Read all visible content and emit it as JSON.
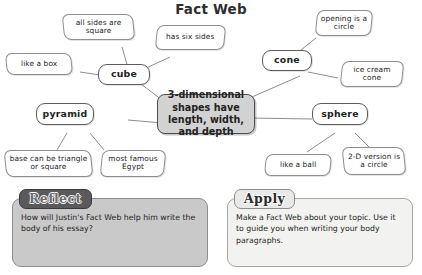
{
  "title": "Fact Web",
  "center_node": {
    "text": "3-dimensional shapes have length, width, and depth"
  },
  "shapes": [
    {
      "id": "cube",
      "label": "cube"
    },
    {
      "id": "cone",
      "label": "cone"
    },
    {
      "id": "pyramid",
      "label": "pyramid"
    },
    {
      "id": "sphere",
      "label": "sphere"
    }
  ],
  "facts": [
    {
      "id": "cube-fact-1",
      "parent": "cube",
      "text": "all sides are square"
    },
    {
      "id": "cube-fact-2",
      "parent": "cube",
      "text": "has six sides"
    },
    {
      "id": "cube-fact-3",
      "parent": "cube",
      "text": "like a box"
    },
    {
      "id": "cone-fact-1",
      "parent": "cone",
      "text": "opening is a circle"
    },
    {
      "id": "cone-fact-2",
      "parent": "cone",
      "text": "ice cream cone"
    },
    {
      "id": "pyramid-fact-1",
      "parent": "pyramid",
      "text": "base can be triangle or square"
    },
    {
      "id": "pyramid-fact-2",
      "parent": "pyramid",
      "text": "most famous Egypt"
    },
    {
      "id": "sphere-fact-1",
      "parent": "sphere",
      "text": "like a ball"
    },
    {
      "id": "sphere-fact-2",
      "parent": "sphere",
      "text": "2-D version is a circle"
    }
  ],
  "panels": {
    "reflect": {
      "tab_label": "Reflect",
      "body": "How will Justin's Fact Web help him write the body of his essay?"
    },
    "apply": {
      "tab_label": "Apply",
      "body": "Make a Fact Web about your topic. Use it to guide you when writing your body paragraphs."
    }
  },
  "colors": {
    "center_fill": "#d2d2d2",
    "reflect_fill": "#c9c9c9",
    "apply_fill": "#f2f2f0",
    "outline": "#8e8e90",
    "text": "#232323"
  }
}
